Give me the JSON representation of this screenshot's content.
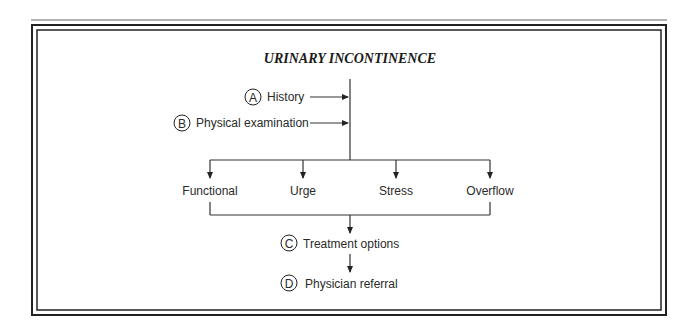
{
  "title": "URINARY INCONTINENCE",
  "inputs": [
    {
      "letter": "A",
      "label": "History"
    },
    {
      "letter": "B",
      "label": "Physical examination"
    }
  ],
  "types": [
    "Functional",
    "Urge",
    "Stress",
    "Overflow"
  ],
  "steps": [
    {
      "letter": "C",
      "label": "Treatment options"
    },
    {
      "letter": "D",
      "label": "Physician referral"
    }
  ],
  "colors": {
    "line": "#333333",
    "text": "#2a2a2a",
    "background": "#ffffff"
  }
}
